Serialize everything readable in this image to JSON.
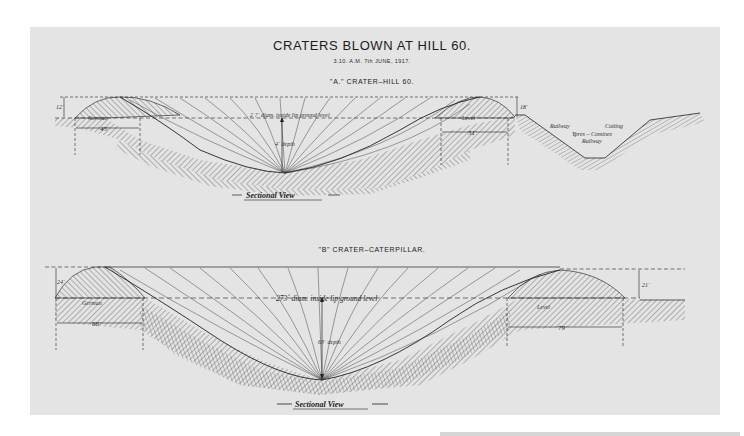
{
  "document": {
    "title": "CRATERS BLOWN AT HILL 60.",
    "subtitle": "3.10. A.M.   7th JUNE, 1917.",
    "colors": {
      "paper": "#e4e4e4",
      "ink": "#222222",
      "background": "#ffffff"
    }
  },
  "crater_a": {
    "heading": "\"A.\" CRATER–HILL 60.",
    "diameter_note": "2 ?´ diam. inside lip ground level",
    "depth_label": "4´ depth",
    "left_lip_height": "12´",
    "right_lip_height": "18´",
    "left_lip_label": "German",
    "right_lip_label": "Level",
    "left_width": "45´",
    "right_width": "51´",
    "railway_label_1": "Railway",
    "railway_label_2": "Cutting",
    "railway_label_3": "Ypres – Comines",
    "railway_label_4": "Railway",
    "caption": "Sectional View"
  },
  "crater_b": {
    "heading": "\"B\"  CRATER–CATERPILLAR.",
    "diameter_note": "273´ diam. inside lip ground level",
    "depth_label": "63´ depth",
    "left_lip_height": "24´",
    "right_lip_height": "21´",
    "left_lip_label": "German",
    "right_lip_label": "Level",
    "left_width": "66´",
    "right_width": "79´",
    "caption": "Sectional View"
  }
}
